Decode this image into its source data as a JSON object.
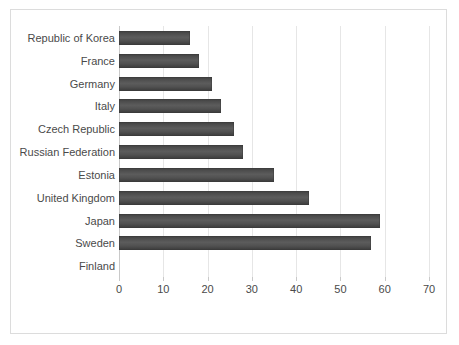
{
  "chart_data": {
    "type": "bar",
    "orientation": "horizontal",
    "title": "",
    "subtitle": "",
    "xlabel": "",
    "ylabel": "",
    "xlim": [
      0,
      70
    ],
    "xticks": [
      0,
      10,
      20,
      30,
      40,
      50,
      60,
      70
    ],
    "xtick_labels": [
      "0",
      "10",
      "20",
      "30",
      "40",
      "50",
      "60",
      "70"
    ],
    "grid": true,
    "legend": false,
    "legend_position": "none",
    "bar_color": "#4d4d4d",
    "categories": [
      "Republic of Korea",
      "France",
      "Germany",
      "Italy",
      "Czech Republic",
      "Russian Federation",
      "Estonia",
      "United Kingdom",
      "Japan",
      "Sweden",
      "Finland"
    ],
    "values": [
      16,
      18,
      21,
      23,
      26,
      28,
      35,
      43,
      59,
      57,
      0
    ]
  }
}
